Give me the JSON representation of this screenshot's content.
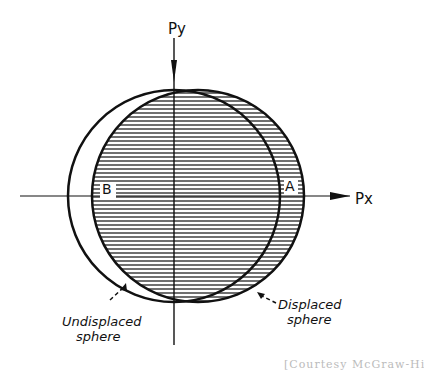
{
  "diagram": {
    "axes": {
      "y_label": "Py",
      "x_label": "Px"
    },
    "regions": {
      "left": "B",
      "right": "A"
    },
    "annotations": {
      "undisplaced": {
        "line1": "Undisplaced",
        "line2": "sphere"
      },
      "displaced": {
        "line1": "Displaced",
        "line2": "sphere"
      }
    },
    "caption": "[Courtesy McGraw-Hill Book"
  },
  "colors": {
    "ink": "#111111",
    "background": "#ffffff",
    "hatch": "#222222"
  }
}
